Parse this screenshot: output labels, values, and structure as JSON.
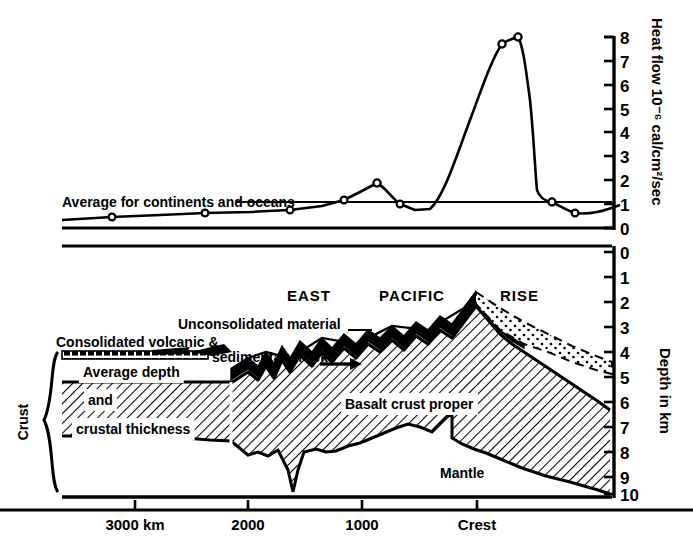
{
  "figure": {
    "title_words": [
      "EAST",
      "PACIFIC",
      "RISE"
    ],
    "title_full": "EAST PACIFIC RISE",
    "ink_color": "#000000",
    "background": "#ffffff"
  },
  "top_panel": {
    "y_axis": {
      "title": "Heat flow 10⁻⁶ cal/cm²/sec",
      "ticks": [
        "0",
        "1",
        "2",
        "3",
        "4",
        "5",
        "6",
        "7",
        "8"
      ],
      "min": 0,
      "max": 8
    },
    "reference_line_label": "Average for continents and oceans",
    "reference_line_value": 1.1
  },
  "bottom_panel": {
    "y_axis": {
      "title": "Depth in km",
      "ticks": [
        "0",
        "1",
        "2",
        "3",
        "4",
        "5",
        "6",
        "7",
        "8",
        "9",
        "10"
      ],
      "min": 0,
      "max": 10
    },
    "annotations": [
      {
        "name": "unconsolidated-material",
        "text": "Unconsolidated material"
      },
      {
        "name": "consolidated-volcanic",
        "text": "Consolidated volcanic &"
      },
      {
        "name": "sedimentary-rocks",
        "text": "sedimentary rocks"
      },
      {
        "name": "average-depth",
        "text": "Average depth"
      },
      {
        "name": "and",
        "text": "and"
      },
      {
        "name": "crustal-thickness",
        "text": "crustal thickness"
      },
      {
        "name": "basalt-crust-proper",
        "text": "Basalt crust proper"
      },
      {
        "name": "mantle",
        "text": "Mantle"
      },
      {
        "name": "crust-bracket",
        "text": "Crust"
      }
    ]
  },
  "x_axis": {
    "title": "",
    "ticks": [
      {
        "label": "3000 km",
        "value": 3000,
        "px": 135
      },
      {
        "label": "2000",
        "value": 2000,
        "px": 248
      },
      {
        "label": "1000",
        "value": 1000,
        "px": 362
      },
      {
        "label": "Crest",
        "value": 0,
        "px": 477
      }
    ]
  },
  "chart_data": {
    "type": "line",
    "title": "EAST PACIFIC RISE",
    "xlabel": "Distance from crest (km)",
    "ylabel": "Heat flow 10⁻⁶ cal/cm²/sec",
    "xlim": [
      3500,
      -500
    ],
    "ylim": [
      0,
      8
    ],
    "grid": false,
    "legend": null,
    "annotations": [
      {
        "text": "Average for continents and oceans",
        "y": 1.1
      }
    ],
    "series": [
      {
        "name": "Heat flow",
        "marker": "open-circle",
        "x_px": [
          64,
          112,
          160,
          205,
          250,
          290,
          322,
          344,
          360,
          377,
          400,
          430,
          470,
          502,
          518,
          530,
          537,
          552,
          575,
          600,
          620
        ],
        "values": [
          0.35,
          0.4,
          0.45,
          0.5,
          0.52,
          0.55,
          0.62,
          0.85,
          1.1,
          1.45,
          1.05,
          0.8,
          3.2,
          7.6,
          8.0,
          6.6,
          3.2,
          1.1,
          0.6,
          0.55,
          0.8
        ],
        "measured_points_px": [
          [
            112,
            0.4
          ],
          [
            205,
            0.5
          ],
          [
            290,
            0.55
          ],
          [
            322,
            0.62
          ],
          [
            377,
            1.45
          ],
          [
            430,
            0.8
          ],
          [
            502,
            7.6
          ],
          [
            518,
            8.0
          ],
          [
            552,
            1.1
          ],
          [
            575,
            0.6
          ]
        ]
      },
      {
        "name": "Baseline (zero)",
        "values": [
          0
        ],
        "style": "solid-horizontal"
      }
    ],
    "secondary_profile": {
      "name": "Seafloor depth profile (km)",
      "ylabel": "Depth in km",
      "ylim": [
        0,
        10
      ],
      "seafloor_km": [
        4.3,
        4.3,
        4.3,
        4.3,
        4.0,
        3.9,
        3.6,
        3.8,
        3.5,
        3.3,
        3.4,
        3.1,
        2.6,
        3.0,
        3.3,
        3.6,
        3.9,
        4.2,
        4.5
      ],
      "moho_km": [
        6.8,
        6.8,
        6.8,
        7.4,
        8.2,
        8.4,
        8.0,
        7.6,
        7.2,
        6.9,
        7.4,
        8.6,
        9.0,
        9.4,
        9.8,
        10.0,
        10.2,
        10.3,
        10.4
      ]
    }
  }
}
